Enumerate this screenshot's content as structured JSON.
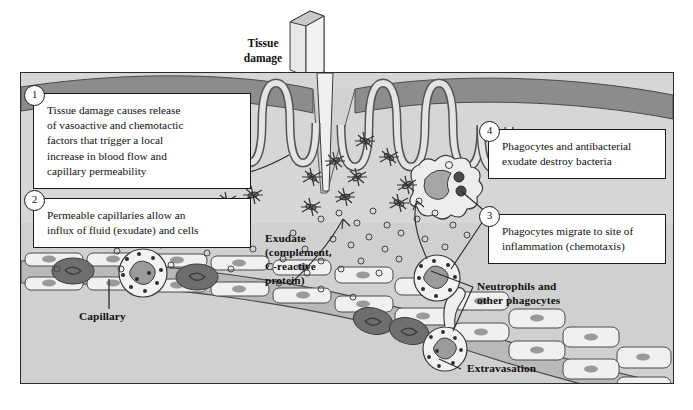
{
  "figure": {
    "title_label": "Tissue damage",
    "background_color": "#d6d6d6",
    "epidermis_color": "#8c8c8c",
    "frame_color": "#2b2b2b"
  },
  "callouts": [
    {
      "number": "1",
      "lines": [
        "Tissue damage causes release",
        "of vasoactive and chemotactic",
        "factors that trigger a local",
        "increase in blood flow and",
        "capillary permeability"
      ]
    },
    {
      "number": "2",
      "lines": [
        "Permeable capillaries allow an",
        "influx of fluid (exudate) and cells"
      ]
    },
    {
      "number": "3",
      "lines": [
        "Phagocytes migrate to site of",
        "inflammation (chemotaxis)"
      ]
    },
    {
      "number": "4",
      "lines": [
        "Phagocytes and antibacterial",
        "exudate destroy bacteria"
      ]
    }
  ],
  "labels": {
    "tissue_damage": [
      "Tissue",
      "damage"
    ],
    "bacteria": "Bacteria",
    "exudate": [
      "Exudate",
      "(complement,",
      "C-reactive",
      "protein)"
    ],
    "capillary": "Capillary",
    "neutrophils": [
      "Neutrophils and",
      "other phagocytes"
    ],
    "extravasation": "Extravasation"
  }
}
